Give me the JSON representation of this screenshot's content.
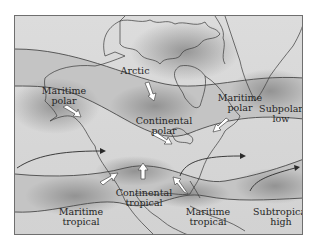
{
  "map": {
    "title": "",
    "air_masses": [
      {
        "id": "arctic",
        "label": "Arctic",
        "line1": "Arctic",
        "line2": ""
      },
      {
        "id": "maritime-polar-pacific",
        "label": "Maritime polar",
        "line1": "Maritime",
        "line2": "polar"
      },
      {
        "id": "continental-polar",
        "label": "Continental polar",
        "line1": "Continental",
        "line2": "polar"
      },
      {
        "id": "maritime-polar-atlantic",
        "label": "Maritime polar",
        "line1": "Maritime",
        "line2": "polar"
      },
      {
        "id": "maritime-tropical-pacific",
        "label": "Maritime tropical",
        "line1": "Maritime",
        "line2": "tropical"
      },
      {
        "id": "continental-tropical",
        "label": "Continental tropical",
        "line1": "Continental",
        "line2": "tropical"
      },
      {
        "id": "maritime-tropical-gulf",
        "label": "Maritime tropical",
        "line1": "Maritime",
        "line2": "tropical"
      }
    ],
    "pressure_systems": [
      {
        "id": "subpolar-low",
        "line1": "Subpolar",
        "line2": "low"
      },
      {
        "id": "subtropical-high",
        "line1": "Subtropical",
        "line2": "high"
      }
    ],
    "colors": {
      "background": "#d6d6d6",
      "band": "#bdbdbd",
      "shadow": "#8a8a8a",
      "outline": "#3a3a3a",
      "arrow_fill": "#ffffff",
      "text": "#262626"
    }
  }
}
